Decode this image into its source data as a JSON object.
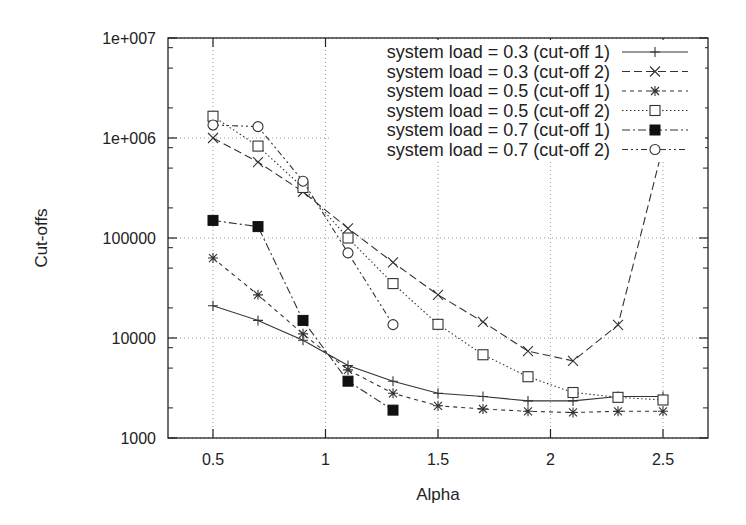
{
  "chart_data": {
    "type": "line",
    "title": "",
    "xlabel": "Alpha",
    "ylabel": "Cut-offs",
    "yscale": "log",
    "xlim": [
      0.3,
      2.7
    ],
    "ylim": [
      1000,
      10000000
    ],
    "grid": true,
    "legend_position": "top-right (inside)",
    "x_ticks": [
      "0.5",
      "1",
      "1.5",
      "2",
      "2.5"
    ],
    "x_tick_values": [
      0.5,
      1,
      1.5,
      2,
      2.5
    ],
    "y_ticks": [
      "1000",
      "10000",
      "100000",
      "1e+006",
      "1e+007"
    ],
    "y_tick_values": [
      1000,
      10000,
      100000,
      1000000,
      10000000
    ],
    "x": [
      0.5,
      0.7,
      0.9,
      1.1,
      1.3,
      1.5,
      1.7,
      1.9,
      2.1,
      2.3,
      2.5
    ],
    "series": [
      {
        "name": "system load = 0.3 (cut-off 1)",
        "marker": "plus",
        "line": "solid",
        "x": [
          0.5,
          0.7,
          0.9,
          1.1,
          1.3,
          1.5,
          1.7,
          1.9,
          2.1,
          2.3,
          2.5
        ],
        "values": [
          21000,
          15000,
          9500,
          5300,
          3700,
          2800,
          2600,
          2350,
          2350,
          2600,
          2600
        ]
      },
      {
        "name": "system load = 0.3 (cut-off 2)",
        "marker": "cross",
        "line": "dashed",
        "x": [
          0.5,
          0.7,
          0.9,
          1.1,
          1.3,
          1.5,
          1.7,
          1.9,
          2.1,
          2.3,
          2.5
        ],
        "values": [
          1000000,
          575000,
          290000,
          125000,
          57000,
          27000,
          14500,
          7400,
          5900,
          13500,
          820000
        ]
      },
      {
        "name": "system load = 0.5 (cut-off 1)",
        "marker": "star",
        "line": "short-dashed",
        "x": [
          0.5,
          0.7,
          0.9,
          1.1,
          1.3,
          1.5,
          1.7,
          1.9,
          2.1,
          2.3,
          2.5
        ],
        "values": [
          63000,
          27000,
          11000,
          4800,
          2800,
          2100,
          1950,
          1850,
          1800,
          1850,
          1850
        ]
      },
      {
        "name": "system load = 0.5 (cut-off 2)",
        "marker": "open-square",
        "line": "dotted",
        "x": [
          0.5,
          0.7,
          0.9,
          1.1,
          1.3,
          1.5,
          1.7,
          1.9,
          2.1,
          2.3,
          2.5
        ],
        "values": [
          1650000,
          830000,
          320000,
          100000,
          35000,
          13700,
          6800,
          4100,
          2850,
          2550,
          2400
        ]
      },
      {
        "name": "system load = 0.7 (cut-off 1)",
        "marker": "filled-square",
        "line": "dash-dot",
        "x": [
          0.5,
          0.7,
          0.9,
          1.1,
          1.3
        ],
        "values": [
          150000,
          130000,
          15000,
          3700,
          1900
        ]
      },
      {
        "name": "system load = 0.7 (cut-off 2)",
        "marker": "open-circle",
        "line": "dash-dot-dot",
        "x": [
          0.5,
          0.7,
          0.9,
          1.1,
          1.3
        ],
        "values": [
          1350000,
          1300000,
          370000,
          71000,
          13600
        ]
      }
    ]
  },
  "legend": {
    "items": [
      {
        "label": "system load = 0.3 (cut-off 1)"
      },
      {
        "label": "system load = 0.3 (cut-off 2)"
      },
      {
        "label": "system load = 0.5 (cut-off 1)"
      },
      {
        "label": "system load = 0.5 (cut-off 2)"
      },
      {
        "label": "system load = 0.7 (cut-off 1)"
      },
      {
        "label": "system load = 0.7 (cut-off 2)"
      }
    ]
  },
  "colors": {
    "line": "#333333",
    "grid": "#999999",
    "axis": "#222222",
    "background": "#ffffff"
  }
}
